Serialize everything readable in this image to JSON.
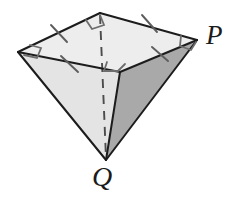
{
  "figure": {
    "kind": "geometry-diagram",
    "background_color": "#ffffff",
    "labels": [
      {
        "name": "vertex-label-P",
        "text": "P",
        "x": 206,
        "y": 22,
        "font_size": 27
      },
      {
        "name": "vertex-label-Q",
        "text": "Q",
        "x": 92,
        "y": 163,
        "font_size": 28
      }
    ],
    "colors": {
      "stroke": "#1c1c1c",
      "tick_stroke": "#5a5a5a",
      "right_angle_stroke": "#6a6a6a",
      "dashed_stroke": "#4a4a4a",
      "face_top": "#ececec",
      "face_left_front": "#e2e2e2",
      "face_right_front": "#a8a8a8",
      "face_right_back": "#c3c3c3"
    },
    "vertices": {
      "top_back": {
        "name": "A",
        "x": 100,
        "y": 13
      },
      "top_left": {
        "name": "B",
        "x": 18,
        "y": 52
      },
      "top_right": {
        "name": "P",
        "x": 197,
        "y": 40
      },
      "top_front": {
        "name": "C",
        "x": 120,
        "y": 72
      },
      "apex": {
        "name": "Q",
        "x": 106,
        "y": 160
      }
    },
    "edges": [
      {
        "name": "edge-back-left",
        "from": "top_back",
        "to": "top_left",
        "style": "solid"
      },
      {
        "name": "edge-back-right",
        "from": "top_back",
        "to": "top_right",
        "style": "solid"
      },
      {
        "name": "edge-front-left",
        "from": "top_left",
        "to": "top_front",
        "style": "solid"
      },
      {
        "name": "edge-front-right",
        "from": "top_front",
        "to": "top_right",
        "style": "solid"
      },
      {
        "name": "edge-left-to-apex",
        "from": "top_left",
        "to": "apex",
        "style": "solid"
      },
      {
        "name": "edge-front-to-apex",
        "from": "top_front",
        "to": "apex",
        "style": "solid"
      },
      {
        "name": "edge-right-to-apex",
        "from": "top_right",
        "to": "apex",
        "style": "solid"
      },
      {
        "name": "edge-back-to-apex",
        "from": "top_back",
        "to": "apex",
        "style": "dashed"
      }
    ],
    "tick_marks": [
      {
        "name": "tick-back-left",
        "edge": "edge-back-left",
        "count": 1
      },
      {
        "name": "tick-back-right",
        "edge": "edge-back-right",
        "count": 1
      },
      {
        "name": "tick-front-left",
        "edge": "edge-front-left",
        "count": 1
      },
      {
        "name": "tick-front-right",
        "edge": "edge-front-right",
        "count": 1
      }
    ],
    "right_angle_markers": [
      {
        "name": "right-angle-top-back",
        "at": "top_back"
      },
      {
        "name": "right-angle-top-left",
        "at": "top_left"
      },
      {
        "name": "right-angle-top-right",
        "at": "top_right"
      },
      {
        "name": "right-angle-top-front",
        "at": "top_front"
      }
    ]
  }
}
